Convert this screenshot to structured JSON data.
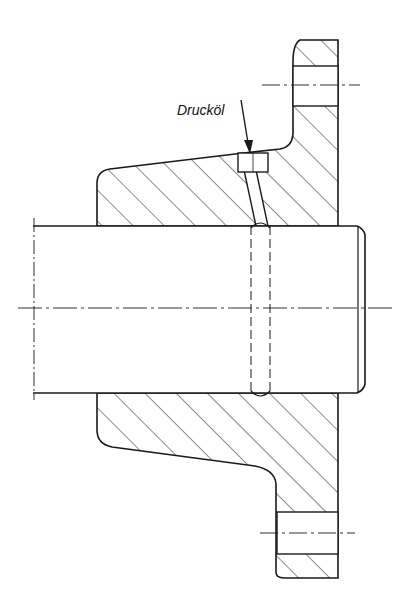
{
  "diagram": {
    "type": "technical-drawing-section",
    "labels": {
      "oil_inlet": "Drucköl"
    },
    "colors": {
      "line": "#1a1a1a",
      "hatch": "#1a1a1a",
      "background": "#ffffff"
    }
  }
}
